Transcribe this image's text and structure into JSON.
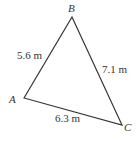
{
  "diagram": {
    "type": "triangle",
    "vertices": [
      {
        "name": "A",
        "x": 24,
        "y": 98
      },
      {
        "name": "B",
        "x": 72,
        "y": 17
      },
      {
        "name": "C",
        "x": 122,
        "y": 125
      }
    ],
    "sides": [
      {
        "between": "AB",
        "label": "5.6 m"
      },
      {
        "between": "BC",
        "label": "7.1 m"
      },
      {
        "between": "AC",
        "label": "6.3 m"
      }
    ],
    "stroke_color": "#333333"
  }
}
